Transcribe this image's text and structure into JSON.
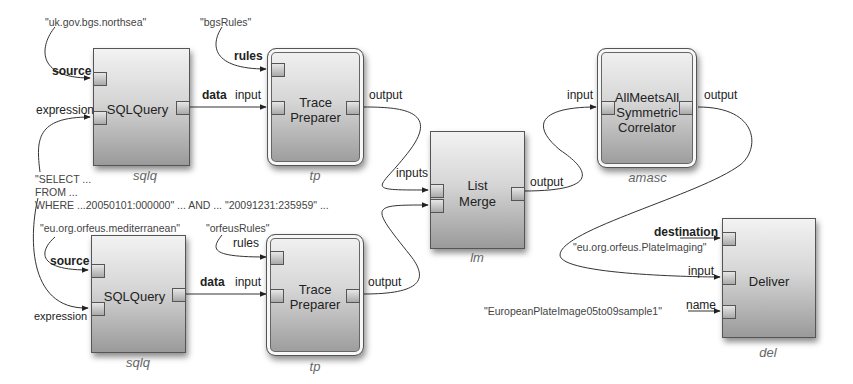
{
  "diagram": {
    "nodes": {
      "sqlq_top": {
        "title": "SQLQuery",
        "instance": "sqlq",
        "ports": {
          "source": "source",
          "expression": "expression",
          "data": "data"
        }
      },
      "tp_top": {
        "title_line1": "Trace",
        "title_line2": "Preparer",
        "instance": "tp",
        "ports": {
          "rules": "rules",
          "input": "input",
          "output": "output"
        }
      },
      "sqlq_bottom": {
        "title": "SQLQuery",
        "instance": "sqlq",
        "ports": {
          "source": "source",
          "expression": "expression",
          "data": "data"
        }
      },
      "tp_bottom": {
        "title_line1": "Trace",
        "title_line2": "Preparer",
        "instance": "tp",
        "ports": {
          "rules": "rules",
          "input": "input",
          "output": "output"
        }
      },
      "lm": {
        "title_line1": "List",
        "title_line2": "Merge",
        "instance": "lm",
        "ports": {
          "inputs": "inputs",
          "output": "output"
        }
      },
      "amasc": {
        "title_line1": "AllMeetsAll",
        "title_line2": "Symmetric",
        "title_line3": "Correlator",
        "instance": "amasc",
        "ports": {
          "input": "input",
          "output": "output"
        }
      },
      "del": {
        "title": "Deliver",
        "instance": "del",
        "ports": {
          "destination": "destination",
          "input": "input",
          "name": "name"
        }
      }
    },
    "literals": {
      "source_top": "\"uk.gov.bgs.northsea\"",
      "rules_top": "\"bgsRules\"",
      "sql_line1": "\"SELECT ...",
      "sql_line2": "FROM ...",
      "sql_line3": "WHERE ...20050101:000000\" ... AND ... \"20091231:235959\" ...",
      "source_bottom": "\"eu.org.orfeus.mediterranean\"",
      "rules_bottom": "\"orfeusRules\"",
      "destination": "\"eu.org.orfeus.PlateImaging\"",
      "name": "\"EuropeanPlateImage05to09sample1\""
    },
    "colors": {
      "wire": "#333333",
      "node_border": "#555555",
      "literal_text": "#444444",
      "instance_text": "#666666"
    }
  }
}
